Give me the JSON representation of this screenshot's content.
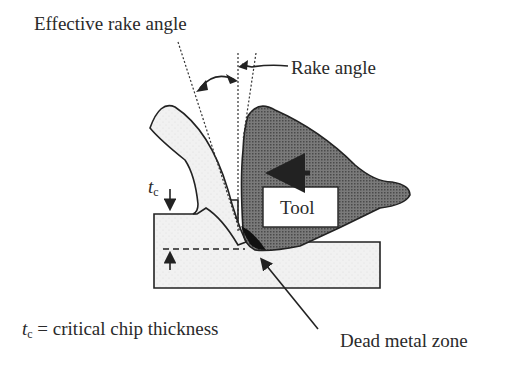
{
  "diagram": {
    "labels": {
      "effective_rake_angle": "Effective rake angle",
      "rake_angle": "Rake angle",
      "tool": "Tool",
      "tc_symbol": "t",
      "tc_subscript": "c",
      "dead_metal_zone": "Dead metal zone",
      "legend_symbol": "t",
      "legend_subscript": "c",
      "legend_text": " = critical chip thickness"
    },
    "colors": {
      "tool_fill": "#6e6e6e",
      "workpiece_fill": "#efefef",
      "dead_zone": "#111111",
      "outline": "#222222"
    }
  }
}
